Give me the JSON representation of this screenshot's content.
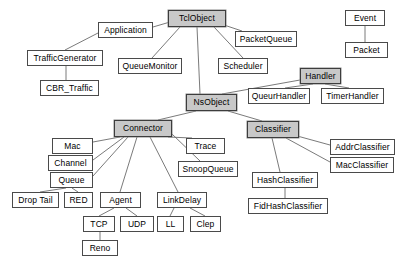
{
  "diagram": {
    "type": "class-hierarchy-tree",
    "colors": {
      "node_fill": "#ffffff",
      "node_fill_highlighted": "#c8c8c8",
      "node_border": "#4a4a4a",
      "edge": "#6b6b6b",
      "background": "#ffffff",
      "text": "#000000"
    },
    "nodes": [
      {
        "id": "tclobject",
        "label": "TclObject",
        "x": 168,
        "y": 10,
        "w": 58,
        "h": 17,
        "highlighted": true
      },
      {
        "id": "application",
        "label": "Application",
        "x": 98,
        "y": 22,
        "w": 55,
        "h": 16,
        "highlighted": false
      },
      {
        "id": "trafficgenerator",
        "label": "TrafficGenerator",
        "x": 27,
        "y": 50,
        "w": 76,
        "h": 16,
        "highlighted": false
      },
      {
        "id": "cbr_traffic",
        "label": "CBR_Traffic",
        "x": 40,
        "y": 80,
        "w": 59,
        "h": 16,
        "highlighted": false
      },
      {
        "id": "queuemonitor",
        "label": "QueueMonitor",
        "x": 118,
        "y": 58,
        "w": 64,
        "h": 16,
        "highlighted": false
      },
      {
        "id": "packetqueue",
        "label": "PacketQueue",
        "x": 235,
        "y": 31,
        "w": 62,
        "h": 16,
        "highlighted": false
      },
      {
        "id": "scheduler",
        "label": "Scheduler",
        "x": 218,
        "y": 58,
        "w": 50,
        "h": 16,
        "highlighted": false
      },
      {
        "id": "event",
        "label": "Event",
        "x": 345,
        "y": 10,
        "w": 40,
        "h": 16,
        "highlighted": false
      },
      {
        "id": "packet",
        "label": "Packet",
        "x": 345,
        "y": 42,
        "w": 43,
        "h": 16,
        "highlighted": false
      },
      {
        "id": "handler",
        "label": "Handler",
        "x": 300,
        "y": 68,
        "w": 41,
        "h": 16,
        "highlighted": true
      },
      {
        "id": "queurhandler",
        "label": "QueurHandler",
        "x": 248,
        "y": 88,
        "w": 62,
        "h": 16,
        "highlighted": false
      },
      {
        "id": "timerhandler",
        "label": "TimerHandler",
        "x": 321,
        "y": 88,
        "w": 63,
        "h": 16,
        "highlighted": false
      },
      {
        "id": "nsobject",
        "label": "NsObject",
        "x": 186,
        "y": 94,
        "w": 51,
        "h": 17,
        "highlighted": true
      },
      {
        "id": "connector",
        "label": "Connector",
        "x": 114,
        "y": 120,
        "w": 58,
        "h": 17,
        "highlighted": true
      },
      {
        "id": "classifier",
        "label": "Classifier",
        "x": 247,
        "y": 121,
        "w": 52,
        "h": 17,
        "highlighted": true
      },
      {
        "id": "trace",
        "label": "Trace",
        "x": 186,
        "y": 138,
        "w": 39,
        "h": 16,
        "highlighted": false
      },
      {
        "id": "snoopqueue",
        "label": "SnoopQueue",
        "x": 178,
        "y": 161,
        "w": 60,
        "h": 16,
        "highlighted": false
      },
      {
        "id": "mac",
        "label": "Mac",
        "x": 52,
        "y": 138,
        "w": 41,
        "h": 16,
        "highlighted": false
      },
      {
        "id": "channel",
        "label": "Channel",
        "x": 48,
        "y": 155,
        "w": 45,
        "h": 16,
        "highlighted": false
      },
      {
        "id": "queue",
        "label": "Queue",
        "x": 50,
        "y": 172,
        "w": 43,
        "h": 16,
        "highlighted": false
      },
      {
        "id": "droptail",
        "label": "Drop Tail",
        "x": 12,
        "y": 192,
        "w": 47,
        "h": 16,
        "highlighted": false
      },
      {
        "id": "red",
        "label": "RED",
        "x": 64,
        "y": 192,
        "w": 29,
        "h": 16,
        "highlighted": false
      },
      {
        "id": "agent",
        "label": "Agent",
        "x": 100,
        "y": 192,
        "w": 41,
        "h": 16,
        "highlighted": false
      },
      {
        "id": "linkdelay",
        "label": "LinkDelay",
        "x": 157,
        "y": 192,
        "w": 50,
        "h": 16,
        "highlighted": false
      },
      {
        "id": "tcp",
        "label": "TCP",
        "x": 83,
        "y": 216,
        "w": 32,
        "h": 16,
        "highlighted": false
      },
      {
        "id": "udp",
        "label": "UDP",
        "x": 120,
        "y": 216,
        "w": 34,
        "h": 16,
        "highlighted": false
      },
      {
        "id": "ll",
        "label": "LL",
        "x": 157,
        "y": 216,
        "w": 27,
        "h": 16,
        "highlighted": false
      },
      {
        "id": "clep",
        "label": "Clep",
        "x": 190,
        "y": 216,
        "w": 31,
        "h": 16,
        "highlighted": false
      },
      {
        "id": "reno",
        "label": "Reno",
        "x": 82,
        "y": 240,
        "w": 36,
        "h": 16,
        "highlighted": false
      },
      {
        "id": "addrclassifier",
        "label": "AddrClassifier",
        "x": 330,
        "y": 139,
        "w": 65,
        "h": 16,
        "highlighted": false
      },
      {
        "id": "macclassifier",
        "label": "MacClassifier",
        "x": 330,
        "y": 157,
        "w": 64,
        "h": 16,
        "highlighted": false
      },
      {
        "id": "hashclassifier",
        "label": "HashClassifier",
        "x": 252,
        "y": 172,
        "w": 66,
        "h": 16,
        "highlighted": false
      },
      {
        "id": "fidhashclassifier",
        "label": "FidHashClassifier",
        "x": 248,
        "y": 198,
        "w": 80,
        "h": 16,
        "highlighted": false
      }
    ],
    "edges": [
      {
        "from": "tclobject",
        "to": "application",
        "x1": 170,
        "y1": 22,
        "x2": 153,
        "y2": 27
      },
      {
        "from": "application",
        "to": "trafficgenerator",
        "x1": 98,
        "y1": 33,
        "x2": 65,
        "y2": 50
      },
      {
        "from": "trafficgenerator",
        "to": "cbr_traffic",
        "x1": 66,
        "y1": 66,
        "x2": 66,
        "y2": 80
      },
      {
        "from": "tclobject",
        "to": "queuemonitor",
        "x1": 180,
        "y1": 27,
        "x2": 152,
        "y2": 58
      },
      {
        "from": "tclobject",
        "to": "packetqueue",
        "x1": 224,
        "y1": 25,
        "x2": 242,
        "y2": 31
      },
      {
        "from": "tclobject",
        "to": "scheduler",
        "x1": 214,
        "y1": 27,
        "x2": 243,
        "y2": 58
      },
      {
        "from": "event",
        "to": "packet",
        "x1": 365,
        "y1": 26,
        "x2": 365,
        "y2": 42
      },
      {
        "from": "handler",
        "to": "queurhandler",
        "x1": 313,
        "y1": 84,
        "x2": 285,
        "y2": 88
      },
      {
        "from": "handler",
        "to": "timerhandler",
        "x1": 325,
        "y1": 84,
        "x2": 349,
        "y2": 88
      },
      {
        "from": "handler",
        "to": "nsobject",
        "x1": 300,
        "y1": 80,
        "x2": 222,
        "y2": 94
      },
      {
        "from": "tclobject",
        "to": "nsobject",
        "x1": 197,
        "y1": 27,
        "x2": 200,
        "y2": 94
      },
      {
        "from": "nsobject",
        "to": "connector",
        "x1": 196,
        "y1": 111,
        "x2": 158,
        "y2": 120
      },
      {
        "from": "nsobject",
        "to": "classifier",
        "x1": 228,
        "y1": 111,
        "x2": 262,
        "y2": 121
      },
      {
        "from": "connector",
        "to": "trace",
        "x1": 168,
        "y1": 137,
        "x2": 192,
        "y2": 138
      },
      {
        "from": "connector",
        "to": "snoopqueue",
        "x1": 172,
        "y1": 134,
        "x2": 200,
        "y2": 161
      },
      {
        "from": "connector",
        "to": "mac",
        "x1": 120,
        "y1": 137,
        "x2": 93,
        "y2": 142
      },
      {
        "from": "connector",
        "to": "channel",
        "x1": 124,
        "y1": 137,
        "x2": 93,
        "y2": 160
      },
      {
        "from": "connector",
        "to": "queue",
        "x1": 128,
        "y1": 137,
        "x2": 93,
        "y2": 176
      },
      {
        "from": "connector",
        "to": "agent",
        "x1": 137,
        "y1": 137,
        "x2": 120,
        "y2": 192
      },
      {
        "from": "connector",
        "to": "linkdelay",
        "x1": 150,
        "y1": 137,
        "x2": 178,
        "y2": 192
      },
      {
        "from": "queue",
        "to": "droptail",
        "x1": 66,
        "y1": 188,
        "x2": 40,
        "y2": 192
      },
      {
        "from": "queue",
        "to": "red",
        "x1": 72,
        "y1": 188,
        "x2": 78,
        "y2": 192
      },
      {
        "from": "agent",
        "to": "tcp",
        "x1": 114,
        "y1": 208,
        "x2": 99,
        "y2": 216
      },
      {
        "from": "agent",
        "to": "udp",
        "x1": 126,
        "y1": 208,
        "x2": 137,
        "y2": 216
      },
      {
        "from": "tcp",
        "to": "reno",
        "x1": 100,
        "y1": 232,
        "x2": 100,
        "y2": 240
      },
      {
        "from": "linkdelay",
        "to": "ll",
        "x1": 174,
        "y1": 208,
        "x2": 170,
        "y2": 216
      },
      {
        "from": "linkdelay",
        "to": "clep",
        "x1": 190,
        "y1": 208,
        "x2": 205,
        "y2": 216
      },
      {
        "from": "classifier",
        "to": "addrclassifier",
        "x1": 290,
        "y1": 134,
        "x2": 330,
        "y2": 145
      },
      {
        "from": "classifier",
        "to": "macclassifier",
        "x1": 286,
        "y1": 138,
        "x2": 330,
        "y2": 162
      },
      {
        "from": "classifier",
        "to": "hashclassifier",
        "x1": 272,
        "y1": 138,
        "x2": 280,
        "y2": 172
      },
      {
        "from": "hashclassifier",
        "to": "fidhashclassifier",
        "x1": 285,
        "y1": 188,
        "x2": 285,
        "y2": 198
      }
    ]
  }
}
